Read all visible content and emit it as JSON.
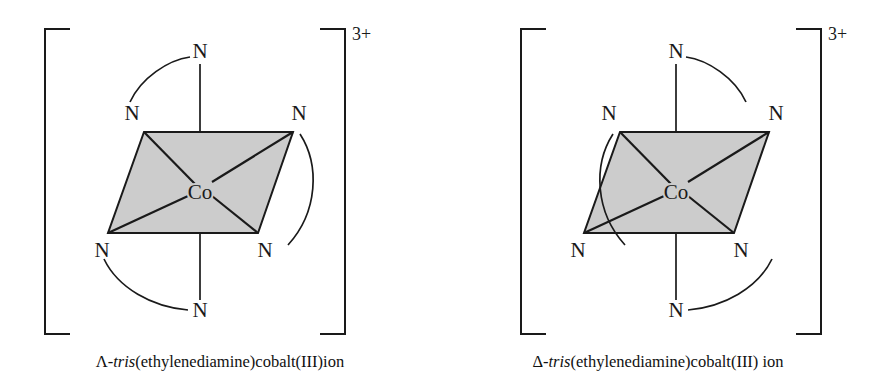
{
  "figure": {
    "background_color": "#ffffff",
    "line_color": "#1a1a1a",
    "face_fill_color": "#cccccc"
  },
  "structures": [
    {
      "id": "lambda-isomer",
      "chirality": "Lambda",
      "charge": "3+",
      "metal_label": "Co",
      "nitrogen_labels": [
        "N",
        "N",
        "N",
        "N",
        "N",
        "N"
      ],
      "ligand_count": 3,
      "bracket": {
        "left_x": 45,
        "right_x": 345,
        "top_y": 28,
        "bottom_y": 335
      }
    },
    {
      "id": "delta-isomer",
      "chirality": "Delta",
      "charge": "3+",
      "metal_label": "Co",
      "nitrogen_labels": [
        "N",
        "N",
        "N",
        "N",
        "N",
        "N"
      ],
      "ligand_count": 3,
      "bracket": {
        "left_x": 521,
        "right_x": 821,
        "top_y": 28,
        "bottom_y": 335
      }
    }
  ],
  "captions": {
    "left": {
      "prefix": "Λ-",
      "italic": "tris",
      "suffix": "(ethylenediamine)cobalt(III)ion"
    },
    "right": {
      "prefix": "Δ-",
      "italic": "tris",
      "suffix": "(ethylenediamine)cobalt(III) ion"
    }
  },
  "labels": {
    "nitrogen": "N",
    "cobalt": "Co",
    "charge": "3+"
  }
}
